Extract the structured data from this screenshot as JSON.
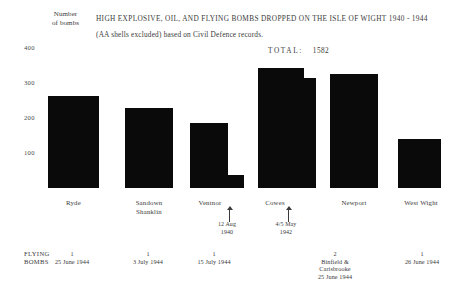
{
  "header": {
    "axis_caption_line1": "Number",
    "axis_caption_line2": "of bombs",
    "title": "HIGH EXPLOSIVE, OIL, AND FLYING BOMBS DROPPED ON THE ISLE OF WIGHT 1940 - 1944",
    "subtitle": "(AA shells excluded)  based on Civil Defence records.",
    "total_label": "TOTAL:",
    "total_value": "1582"
  },
  "chart_data": {
    "type": "bar",
    "title": "HIGH EXPLOSIVE, OIL, AND FLYING BOMBS DROPPED ON THE ISLE OF WIGHT 1940 - 1944",
    "subtitle": "(AA shells excluded)  based on Civil Defence records.",
    "xlabel": "",
    "ylabel": "Number of bombs",
    "ylim": [
      0,
      430
    ],
    "yticks": [
      100,
      200,
      300,
      400
    ],
    "ytick_labels": [
      "100",
      "200",
      "300",
      "400"
    ],
    "grid": false,
    "legend": "none",
    "total": 1582,
    "categories": [
      "Ryde",
      "Sandown Shanklin",
      "Ventnor",
      "Cowes",
      "Newport",
      "West Wight"
    ],
    "values": [
      263,
      229,
      186,
      343,
      326,
      140
    ],
    "step_values": [
      null,
      null,
      38,
      314,
      null,
      null
    ],
    "series": [
      {
        "name": "Bombs dropped",
        "values": [
          263,
          229,
          186,
          343,
          326,
          140
        ]
      }
    ]
  },
  "yticks": [
    {
      "label": "400",
      "top": 44
    },
    {
      "label": "300",
      "top": 79
    },
    {
      "label": "200",
      "top": 114
    },
    {
      "label": "100",
      "top": 149
    }
  ],
  "bars": [
    {
      "name": "ryde",
      "left": 48,
      "width": 51,
      "height": 92,
      "step": null
    },
    {
      "name": "sandown-shanklin",
      "left": 125,
      "width": 48,
      "height": 80,
      "step": null
    },
    {
      "name": "ventnor",
      "left": 190,
      "width": 38,
      "height": 65,
      "step": {
        "left": 228,
        "width": 16,
        "height": 13
      }
    },
    {
      "name": "cowes",
      "left": 258,
      "width": 46,
      "height": 120,
      "step": {
        "left": 304,
        "width": 12,
        "height": 110
      }
    },
    {
      "name": "newport",
      "left": 330,
      "width": 48,
      "height": 114,
      "step": null
    },
    {
      "name": "west-wight",
      "left": 398,
      "width": 43,
      "height": 49,
      "step": null
    }
  ],
  "category_labels": [
    {
      "name": "ryde",
      "text": "Ryde",
      "left": 48,
      "width": 51,
      "top": 199
    },
    {
      "name": "sandown-shanklin",
      "line1": "Sandown",
      "line2": "Shanklin",
      "left": 121,
      "width": 56,
      "top": 199
    },
    {
      "name": "ventnor",
      "text": "Ventnor",
      "left": 186,
      "width": 48,
      "top": 199
    },
    {
      "name": "cowes",
      "text": "Cowes",
      "left": 252,
      "width": 46,
      "top": 199
    },
    {
      "name": "newport",
      "text": "Newport",
      "left": 328,
      "width": 52,
      "top": 199
    },
    {
      "name": "west-wight",
      "text": "West Wight",
      "left": 394,
      "width": 54,
      "top": 199
    }
  ],
  "event_markers": [
    {
      "name": "ventnor-raid",
      "arrow_left": 225,
      "arrow_top": 206,
      "text_left": 206,
      "text_top": 221,
      "text_width": 42,
      "line1": "12 Aug",
      "line2": "1940"
    },
    {
      "name": "cowes-raid",
      "arrow_left": 284,
      "arrow_top": 206,
      "text_left": 265,
      "text_top": 221,
      "text_width": 42,
      "line1": "4/5 May",
      "line2": "1942"
    }
  ],
  "flying_bombs": {
    "title_line1": "FLYING",
    "title_line2": "BOMBS",
    "entries": [
      {
        "name": "ryde",
        "left": 44,
        "width": 56,
        "count": "1",
        "place": "",
        "date": "25 June 1944"
      },
      {
        "name": "sandown-shanklin",
        "left": 120,
        "width": 56,
        "count": "1",
        "place": "",
        "date": "3 July 1944"
      },
      {
        "name": "ventnor",
        "left": 186,
        "width": 56,
        "count": "1",
        "place": "",
        "date": "15 July 1944"
      },
      {
        "name": "newport",
        "left": 300,
        "width": 70,
        "count": "2",
        "place": "Binfield &\nCarisbrooke",
        "date": "25 June 1944"
      },
      {
        "name": "west-wight",
        "left": 392,
        "width": 60,
        "count": "1",
        "place": "",
        "date": "26 June 1944"
      }
    ]
  }
}
